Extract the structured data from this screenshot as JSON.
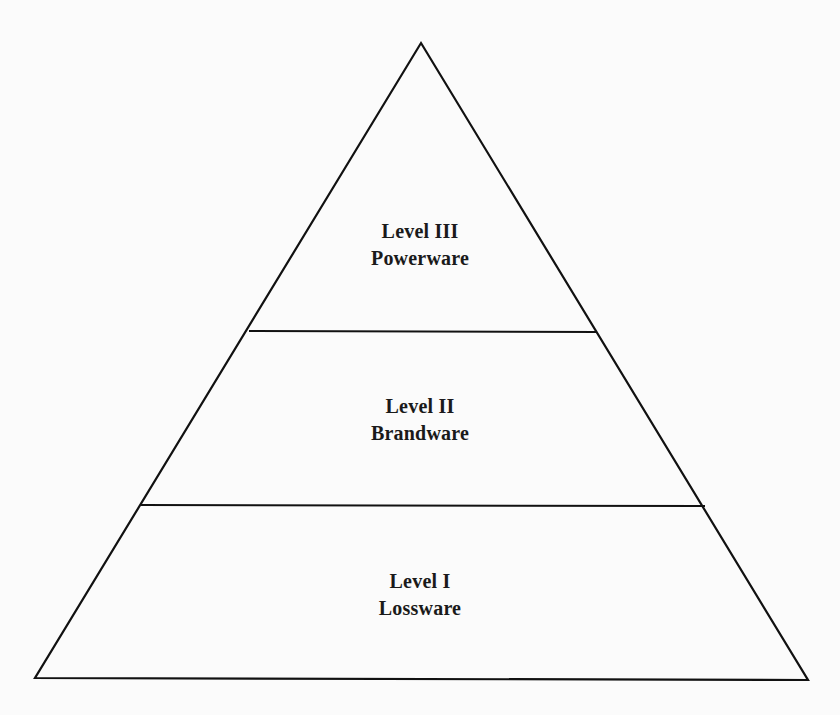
{
  "diagram": {
    "type": "pyramid",
    "stroke_color": "#111111",
    "background_color": "#fbfbfb",
    "levels": [
      {
        "level": "Level III",
        "name": "Powerware",
        "position": "top"
      },
      {
        "level": "Level II",
        "name": "Brandware",
        "position": "middle"
      },
      {
        "level": "Level I",
        "name": "Lossware",
        "position": "bottom"
      }
    ]
  }
}
